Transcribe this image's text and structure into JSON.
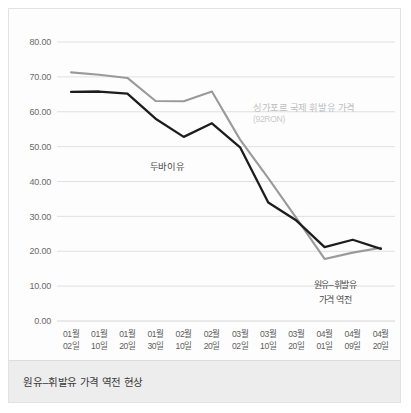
{
  "caption": {
    "text": "원유–휘발유 가격 역전 현상"
  },
  "annotations": {
    "dubai_label": "두바이유",
    "singapore_label": "싱가포르 국제 휘발유 가격",
    "singapore_sublabel": "(92RON)",
    "reversal_line1": "원유–휘발유",
    "reversal_line2": "가격 역전"
  },
  "colors": {
    "dubai_line": "#1d1d1d",
    "singapore_line": "#9a9a9a",
    "grid": "#d8d8d8",
    "caption_band": "#ededed",
    "figure_border": "#e2e2e2"
  },
  "chart_data": {
    "type": "line",
    "title": "원유–휘발유 가격 역전 현상",
    "xlabel": "",
    "ylabel": "",
    "ylim": [
      0,
      80
    ],
    "yticks": [
      "0.00",
      "10.00",
      "20.00",
      "30.00",
      "40.00",
      "50.00",
      "60.00",
      "70.00",
      "80.00"
    ],
    "ytick_values": [
      0,
      10,
      20,
      30,
      40,
      50,
      60,
      70,
      80
    ],
    "grid": true,
    "legend": "annotations-inline",
    "categories": [
      "01월\n02일",
      "01월\n10일",
      "01월\n20일",
      "01월\n30일",
      "02월\n10일",
      "02월\n20일",
      "03월\n02일",
      "03월\n10일",
      "03월\n20일",
      "04월\n01일",
      "04월\n09일",
      "04월\n20일"
    ],
    "categories_top": [
      "01월",
      "01월",
      "01월",
      "01월",
      "02월",
      "02월",
      "03월",
      "03월",
      "03월",
      "04월",
      "04월",
      "04월"
    ],
    "categories_bottom": [
      "02일",
      "10일",
      "20일",
      "30일",
      "10일",
      "20일",
      "02일",
      "10일",
      "20일",
      "01일",
      "09일",
      "20일"
    ],
    "series": [
      {
        "name": "두바이유",
        "color": "#1d1d1d",
        "values": [
          65.7,
          65.8,
          65.2,
          58.0,
          52.8,
          56.7,
          49.8,
          34.0,
          28.8,
          21.2,
          23.3,
          20.7
        ]
      },
      {
        "name": "싱가포르 국제 휘발유 가격 (92RON)",
        "color": "#9a9a9a",
        "values": [
          71.3,
          70.6,
          69.7,
          63.1,
          63.0,
          65.8,
          52.0,
          41.0,
          29.5,
          17.8,
          19.6,
          21.0
        ]
      }
    ]
  }
}
